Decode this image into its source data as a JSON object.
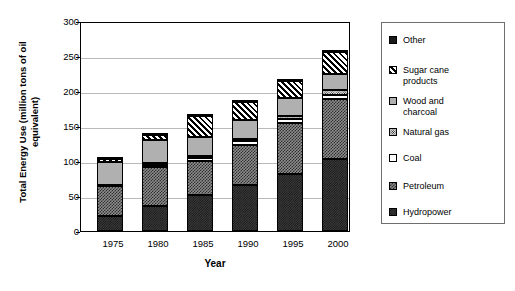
{
  "chart_data": {
    "type": "bar",
    "subtype": "stacked-bar",
    "title": "",
    "xlabel": "Year",
    "ylabel": "Total Energy Use (million tons of oil equivalent)",
    "categories": [
      "1975",
      "1980",
      "1985",
      "1990",
      "1995",
      "2000"
    ],
    "ylim": [
      0,
      300
    ],
    "yticks": [
      0,
      50,
      100,
      150,
      200,
      250,
      300
    ],
    "ytick_labels": [
      "0",
      "50",
      "100",
      "150",
      "200",
      "250",
      "300"
    ],
    "grid": true,
    "grid_axis": "y",
    "legend_position": "right",
    "stack_order_bottom_to_top": [
      "Hydropower",
      "Petroleum",
      "Coal",
      "Natural gas",
      "Wood and charcoal",
      "Sugar cane products",
      "Other"
    ],
    "series": [
      {
        "name": "Hydropower",
        "pattern": "dark-gray-weave",
        "values": [
          21,
          36,
          52,
          66,
          82,
          103
        ]
      },
      {
        "name": "Petroleum",
        "pattern": "checkerboard",
        "values": [
          43,
          55,
          48,
          57,
          72,
          85
        ]
      },
      {
        "name": "Coal",
        "pattern": "white",
        "values": [
          1,
          4,
          4,
          5,
          6,
          7
        ]
      },
      {
        "name": "Natural gas",
        "pattern": "fine-dots",
        "values": [
          1,
          2,
          3,
          4,
          5,
          6
        ]
      },
      {
        "name": "Wood and charcoal",
        "pattern": "light-gray",
        "values": [
          33,
          33,
          28,
          26,
          25,
          24
        ]
      },
      {
        "name": "Sugar cane products",
        "pattern": "diagonal-hatch",
        "values": [
          4,
          7,
          29,
          26,
          25,
          31
        ]
      },
      {
        "name": "Other",
        "pattern": "solid-black",
        "values": [
          1,
          1,
          1,
          1,
          2,
          2
        ]
      }
    ],
    "totals": [
      104,
      138,
      165,
      185,
      217,
      258
    ]
  },
  "axes": {
    "y": {
      "label_line1": "Total Energy Use (million tons of oil",
      "label_line2": "equivalent)",
      "ticks": [
        "300",
        "250",
        "200",
        "150",
        "100",
        "50",
        "0"
      ]
    },
    "x": {
      "label": "Year",
      "ticks": [
        "1975",
        "1980",
        "1985",
        "1990",
        "1995",
        "2000"
      ]
    }
  },
  "legend": {
    "items": [
      {
        "label": "Other",
        "swatch": "solid-black-swatch"
      },
      {
        "label": "Sugar cane\nproducts",
        "swatch": "diagonal-hatch-swatch"
      },
      {
        "label": "Wood and\ncharcoal",
        "swatch": "light-gray-swatch"
      },
      {
        "label": "Natural gas",
        "swatch": "fine-dots-swatch"
      },
      {
        "label": "Coal",
        "swatch": "white-swatch"
      },
      {
        "label": "Petroleum",
        "swatch": "checkerboard-swatch"
      },
      {
        "label": "Hydropower",
        "swatch": "dark-gray-weave-swatch"
      }
    ]
  },
  "colors": {
    "background": "#ffffff",
    "foreground": "#000000",
    "gridline": "#b9b9b9",
    "legend_border": "#6f6f6f"
  }
}
